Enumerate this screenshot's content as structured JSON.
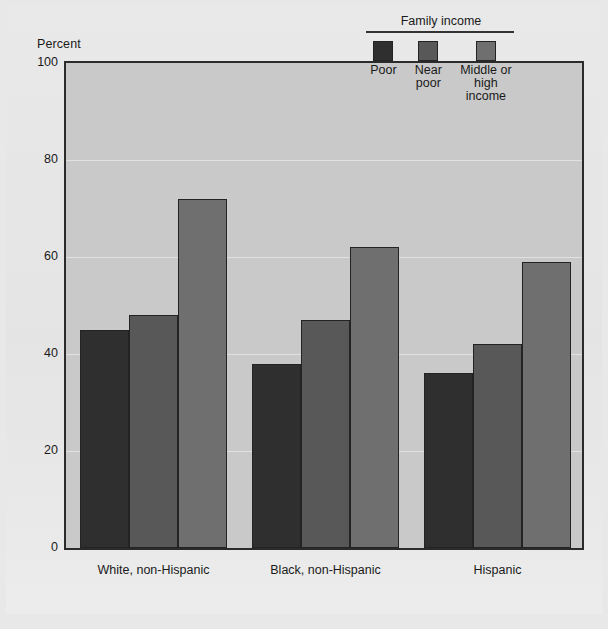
{
  "chart_data": {
    "type": "bar",
    "title": "",
    "subtitle": "",
    "xlabel": "",
    "ylabel": "Percent",
    "ylim": [
      0,
      100
    ],
    "yticks": [
      0,
      20,
      40,
      60,
      80,
      100
    ],
    "grid": true,
    "legend_position": "top-right",
    "legend_title": "Family income",
    "categories": [
      "White, non-Hispanic",
      "Black, non-Hispanic",
      "Hispanic"
    ],
    "series": [
      {
        "name": "Poor",
        "color": "#2f2f2f",
        "values": [
          45,
          38,
          36
        ]
      },
      {
        "name": "Near poor",
        "color": "#585858",
        "values": [
          48,
          47,
          42
        ]
      },
      {
        "name": "Middle or high income",
        "color": "#6f6f6f",
        "values": [
          72,
          62,
          59
        ]
      }
    ]
  },
  "axis": {
    "y_title": "Percent",
    "y_ticks": [
      "100",
      "80",
      "60",
      "40",
      "20",
      "0"
    ]
  },
  "legend": {
    "title": "Family income",
    "items": [
      {
        "label": "Poor",
        "color": "#2f2f2f"
      },
      {
        "label": "Near\npoor",
        "color": "#585858"
      },
      {
        "label": "Middle or\nhigh income",
        "color": "#6f6f6f"
      }
    ]
  },
  "categories": [
    {
      "label": "White, non-Hispanic"
    },
    {
      "label": "Black, non-Hispanic"
    },
    {
      "label": "Hispanic"
    }
  ],
  "colors": {
    "figure_background": "#e6e6e6",
    "plot_background": "#c9c9c9",
    "frame": "#2b2b2b",
    "text": "#1a1a1a",
    "series_poor": "#2f2f2f",
    "series_near_poor": "#585858",
    "series_middle_high": "#6f6f6f"
  }
}
